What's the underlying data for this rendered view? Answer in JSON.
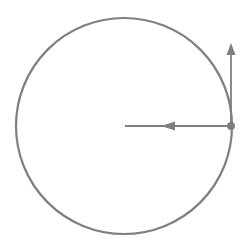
{
  "diagram": {
    "colors": {
      "stroke": "#7f7f7f",
      "background": "#ffffff"
    },
    "circle": {
      "cx": 124,
      "cy": 126,
      "r": 108,
      "stroke_width": 2.2
    },
    "point": {
      "cx": 231,
      "cy": 126,
      "r": 4
    },
    "velocity_vector": {
      "x1": 231,
      "y1": 126,
      "x2": 231,
      "y2": 43,
      "direction": "up"
    },
    "centripetal_vector": {
      "x1": 231,
      "y1": 126,
      "x2": 125,
      "y2": 126,
      "arrowhead_x": 168,
      "direction": "left"
    }
  }
}
